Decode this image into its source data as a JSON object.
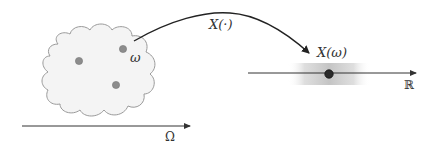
{
  "diagram": {
    "sample_space": {
      "axis_label": "Ω",
      "points": [
        {
          "x": 79,
          "y": 61
        },
        {
          "x": 123,
          "y": 49
        },
        {
          "x": 116,
          "y": 85
        }
      ],
      "highlighted_point_label": "ω"
    },
    "mapping": {
      "label": "X(·)"
    },
    "real_line": {
      "axis_label": "ℝ",
      "image_point_label": "X(ω)"
    },
    "colors": {
      "cloud_fill": "#f4f4f4",
      "cloud_stroke": "#9a9a9a",
      "dot_fill": "#8c8c8c",
      "dot_stroke": "#777777",
      "axis": "#333333",
      "image_dot": "#2a2a2a",
      "band": "#c8c8c8"
    }
  }
}
